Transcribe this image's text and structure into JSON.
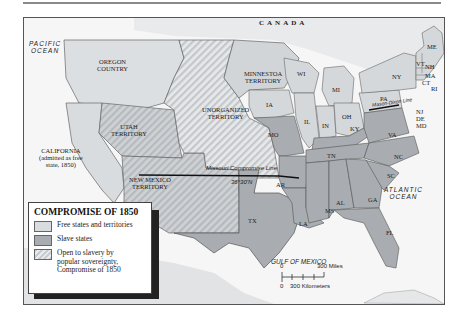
{
  "title": "COMPROMISE OF 1850",
  "legend": {
    "title": "COMPROMISE OF 1850",
    "items": [
      {
        "key": "free",
        "label": "Free states and territories",
        "color": "#d9dcdf"
      },
      {
        "key": "slave",
        "label": "Slave states",
        "color": "#a9acb0"
      },
      {
        "key": "popular",
        "label": "Open to slavery by popular sovereignty, Compromise of 1850",
        "pattern": "diagonal-hatch"
      }
    ]
  },
  "labels": {
    "canada": "CANADA",
    "pacific_ocean_1": "PACIFIC",
    "pacific_ocean_2": "OCEAN",
    "atlantic_ocean_1": "ATLANTIC",
    "atlantic_ocean_2": "OCEAN",
    "gulf_of_mexico": "GULF OF MEXICO",
    "oregon_1": "OREGON",
    "oregon_2": "COUNTRY",
    "minnesota_1": "MINNESTOA",
    "minnesota_2": "TERRITORY",
    "unorganized_1": "UNORGANIZED",
    "unorganized_2": "TERRITORY",
    "utah_1": "UTAH",
    "utah_2": "TERRITORY",
    "california_1": "CALIFORNIA",
    "california_2": "(admitted as free",
    "california_3": "state, 1850)",
    "new_mexico_1": "NEW MEXICO",
    "new_mexico_2": "TERRITORY",
    "missouri_line": "Missouri Compromise Line",
    "missouri_lat": "36°30'N",
    "mason_dixon": "Mason-Dixon Line"
  },
  "states": {
    "free": [
      "WI",
      "MI",
      "IA",
      "IL",
      "IN",
      "OH",
      "PA",
      "NY",
      "NJ",
      "VT",
      "NH",
      "ME",
      "MA",
      "CT",
      "RI"
    ],
    "slave": [
      "MO",
      "AR",
      "TX",
      "LA",
      "MS",
      "AL",
      "TN",
      "KY",
      "GA",
      "FL",
      "SC",
      "NC",
      "VA",
      "DE",
      "MD"
    ]
  },
  "scale": {
    "miles_zero": "0",
    "miles_label": "300 Miles",
    "km_zero": "0",
    "km_label": "300 Kilometers"
  },
  "colors": {
    "free": "#d9dcdf",
    "slave": "#a9acb0",
    "unorganized_hatch": "#c9ccd0",
    "land_base": "#e4e6e8",
    "water": "#f7f7f7",
    "border": "#444444"
  }
}
